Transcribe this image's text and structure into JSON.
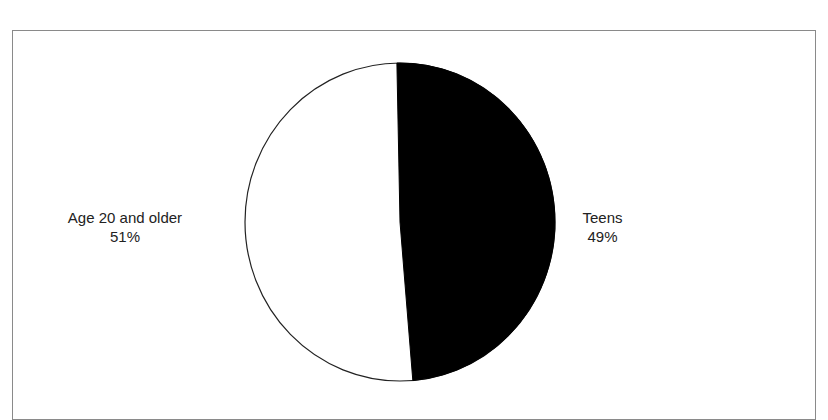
{
  "chart_data": {
    "type": "pie",
    "title": "",
    "slices": [
      {
        "label": "Teens",
        "value": 49,
        "display": "49%",
        "color": "#000000"
      },
      {
        "label": "Age 20 and older",
        "value": 51,
        "display": "51%",
        "color": "#ffffff"
      }
    ],
    "legend": "none (direct labels)",
    "start_angle_note": "Teens slice begins at top, clockwise"
  },
  "labels": {
    "left_name": "Age 20 and older",
    "left_pct": "51%",
    "right_name": "Teens",
    "right_pct": "49%"
  }
}
